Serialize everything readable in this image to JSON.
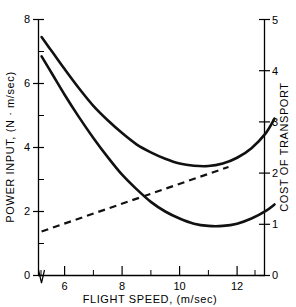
{
  "chart_data": {
    "type": "line",
    "title": "",
    "xlabel": "FLIGHT  SPEED, (m/sec)",
    "ylabel": "POWER  INPUT, (N · m/sec)",
    "y2label": "COST  OF  TRANSPORT",
    "xlim": [
      4.8,
      13.4
    ],
    "ylim": [
      0,
      8.8
    ],
    "y2lim": [
      0,
      5.4
    ],
    "grid": false,
    "legend": "none",
    "x_ticks_major": [
      6,
      8,
      10,
      12
    ],
    "x_ticks_major_labels": [
      "6",
      "8",
      "10",
      "12"
    ],
    "x_ticks_minor": [
      5,
      7,
      9,
      11,
      13
    ],
    "y_ticks_major": [
      0,
      2,
      4,
      6,
      8
    ],
    "y_ticks_major_labels": [
      "0",
      "2",
      "4",
      "6",
      "8"
    ],
    "y_ticks_minor": [
      1,
      3,
      5,
      7
    ],
    "y2_ticks_major": [
      0,
      1,
      2,
      3,
      4,
      5
    ],
    "y2_ticks_major_labels": [
      "0",
      "1",
      "2",
      "3",
      "4",
      "5"
    ],
    "series": [
      {
        "name": "power-input-upper",
        "style": "solid",
        "axis": "left",
        "x": [
          5.2,
          5.6,
          6.0,
          6.5,
          7.0,
          7.5,
          8.0,
          8.5,
          9.0,
          9.5,
          10.0,
          10.5,
          11.0,
          11.5,
          12.0,
          12.5,
          13.0,
          13.3
        ],
        "y": [
          7.45,
          6.95,
          6.45,
          5.85,
          5.3,
          4.85,
          4.45,
          4.1,
          3.85,
          3.65,
          3.5,
          3.43,
          3.42,
          3.5,
          3.68,
          3.98,
          4.45,
          4.9
        ]
      },
      {
        "name": "power-input-lower",
        "style": "solid",
        "axis": "left",
        "x": [
          5.2,
          5.6,
          6.0,
          6.5,
          7.0,
          7.5,
          8.0,
          8.5,
          9.0,
          9.5,
          10.0,
          10.5,
          11.0,
          11.5,
          12.0,
          12.5,
          13.0,
          13.3
        ],
        "y": [
          6.85,
          6.25,
          5.65,
          4.95,
          4.3,
          3.7,
          3.15,
          2.7,
          2.3,
          2.0,
          1.78,
          1.62,
          1.55,
          1.55,
          1.62,
          1.78,
          2.02,
          2.22
        ]
      },
      {
        "name": "cost-of-transport",
        "style": "dashed",
        "axis": "right",
        "x": [
          5.2,
          11.7
        ],
        "y": [
          0.86,
          2.12
        ]
      }
    ]
  },
  "axes": {
    "left_title": "POWER  INPUT, (N · m/sec)",
    "right_title": "COST  OF  TRANSPORT",
    "bottom_title": "FLIGHT  SPEED, (m/sec)"
  }
}
